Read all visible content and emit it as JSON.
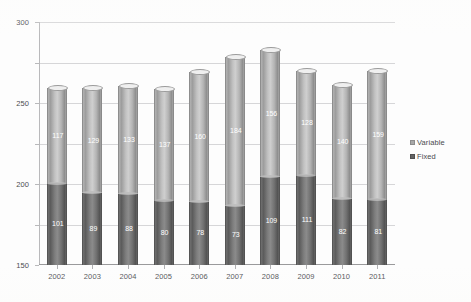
{
  "chart_data": {
    "type": "bar",
    "subtype": "stacked-column-3d-cylinder",
    "title": "",
    "xlabel": "",
    "ylabel": "",
    "ylim": [
      0,
      300
    ],
    "yticks": [
      0,
      50,
      100,
      150,
      200,
      250,
      300
    ],
    "grid": true,
    "legend_position": "right",
    "categories": [
      "2002",
      "2003",
      "2004",
      "2005",
      "2006",
      "2007",
      "2008",
      "2009",
      "2010",
      "2011"
    ],
    "series": [
      {
        "name": "Fixed",
        "color": "#636363",
        "values": [
          101,
          89,
          88,
          80,
          78,
          73,
          109,
          111,
          82,
          81
        ]
      },
      {
        "name": "Variable",
        "color": "#a8a8a8",
        "values": [
          117,
          129,
          133,
          137,
          160,
          184,
          156,
          128,
          140,
          159
        ]
      }
    ],
    "totals": [
      218,
      218,
      221,
      217,
      238,
      257,
      265,
      239,
      222,
      240
    ]
  },
  "title_strip": {
    "text": ""
  },
  "legend": {
    "items": [
      {
        "label": "Variable",
        "marker": "square-light-icon"
      },
      {
        "label": "Fixed",
        "marker": "square-dark-icon"
      }
    ]
  }
}
